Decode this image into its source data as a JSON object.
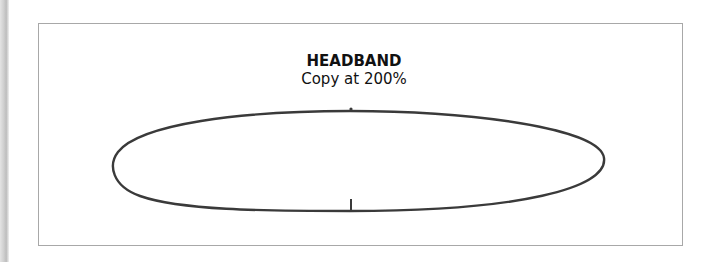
{
  "pattern": {
    "title": "HEADBAND",
    "subtitle": "Copy at 200%"
  },
  "colors": {
    "outline": "#3a3a3a",
    "frame_border": "#a8a8a8",
    "background": "#ffffff"
  }
}
